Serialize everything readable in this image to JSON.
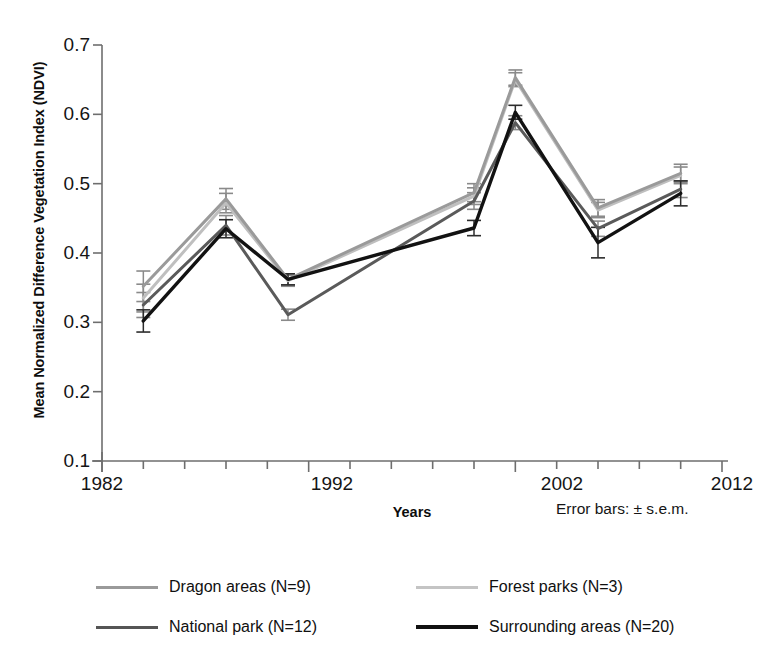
{
  "chart_data": {
    "type": "line",
    "title": "",
    "xlabel": "Years",
    "ylabel": "Mean Normalized Difference Vegetation Index (NDVI)",
    "xlim": [
      1982,
      2012
    ],
    "ylim": [
      0.1,
      0.7
    ],
    "xticks": [
      1982,
      1992,
      2002,
      2012
    ],
    "xticklabels": [
      "1982",
      "1992",
      "2002",
      "2012"
    ],
    "xminor_tick_interval": 2,
    "yticks": [
      0.1,
      0.2,
      0.3,
      0.4,
      0.5,
      0.6,
      0.7
    ],
    "yticklabels": [
      "0.1",
      "0.2",
      "0.3",
      "0.4",
      "0.5",
      "0.6",
      "0.7"
    ],
    "grid": false,
    "legend_position": "below-plot",
    "annotation": "Error bars: ± s.e.m.",
    "x": [
      1984,
      1988,
      1991,
      2000,
      2002,
      2006,
      2010
    ],
    "series": [
      {
        "name": "Dragon areas (N=9)",
        "color": "#9a9a9a",
        "linewidth": 3,
        "values": [
          0.352,
          0.478,
          0.362,
          0.487,
          0.653,
          0.465,
          0.515
        ],
        "errors": [
          0.022,
          0.015,
          0.008,
          0.013,
          0.011,
          0.012,
          0.013
        ]
      },
      {
        "name": "Forest parks (N=3)",
        "color": "#bfbfbf",
        "linewidth": 3,
        "values": [
          0.335,
          0.472,
          0.36,
          0.482,
          0.65,
          0.462,
          0.512
        ],
        "errors": [
          0.02,
          0.014,
          0.008,
          0.012,
          0.01,
          0.011,
          0.012
        ]
      },
      {
        "name": "National park (N=12)",
        "color": "#5a5a5a",
        "linewidth": 3,
        "values": [
          0.325,
          0.44,
          0.311,
          0.475,
          0.588,
          0.435,
          0.492
        ],
        "errors": [
          0.018,
          0.014,
          0.008,
          0.012,
          0.01,
          0.011,
          0.012
        ]
      },
      {
        "name": "Surrounding areas (N=20)",
        "color": "#121212",
        "linewidth": 3.4,
        "values": [
          0.302,
          0.435,
          0.362,
          0.436,
          0.603,
          0.415,
          0.486
        ],
        "errors": [
          0.016,
          0.013,
          0.008,
          0.011,
          0.01,
          0.022,
          0.018
        ]
      }
    ]
  },
  "axes": {
    "axis_color": "#6e6e6e",
    "error_bar_color": "#8a8a8a"
  },
  "legend": {
    "entries": [
      {
        "label": "Dragon areas (N=9)",
        "color": "#9a9a9a",
        "width": 3
      },
      {
        "label": "Forest parks (N=3)",
        "color": "#c4c4c4",
        "width": 3
      },
      {
        "label": "National park (N=12)",
        "color": "#555555",
        "width": 3.4
      },
      {
        "label": "Surrounding areas (N=20)",
        "color": "#111111",
        "width": 4.2
      }
    ]
  }
}
